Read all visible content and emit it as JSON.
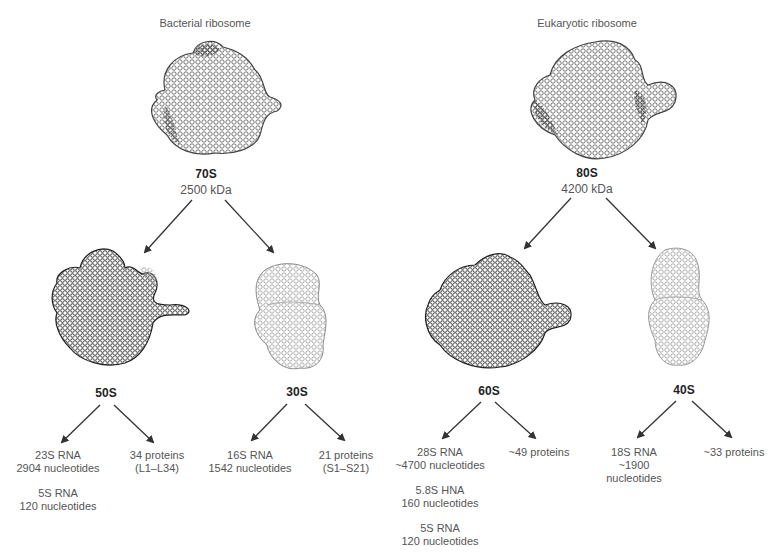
{
  "bacterial": {
    "title": "Bacterial ribosome",
    "whole": {
      "name": "70S",
      "mass": "2500 kDa"
    },
    "large": {
      "name": "50S",
      "rna": [
        {
          "line1": "23S RNA",
          "line2": "2904 nucleotides"
        },
        {
          "line1": "5S RNA",
          "line2": "120 nucleotides"
        }
      ],
      "proteins": {
        "line1": "34 proteins",
        "line2": "(L1–L34)"
      }
    },
    "small": {
      "name": "30S",
      "rna": [
        {
          "line1": "16S RNA",
          "line2": "1542 nucleotides"
        }
      ],
      "proteins": {
        "line1": "21 proteins",
        "line2": "(S1–S21)"
      }
    }
  },
  "eukaryotic": {
    "title": "Eukaryotic ribosome",
    "whole": {
      "name": "80S",
      "mass": "4200 kDa"
    },
    "large": {
      "name": "60S",
      "rna": [
        {
          "line1": "28S RNA",
          "line2": "~4700 nucleotides"
        },
        {
          "line1": "5.8S HNA",
          "line2": "160 nucleotides"
        },
        {
          "line1": "5S RNA",
          "line2": "120 nucleotides"
        }
      ],
      "proteins": {
        "line1": "~49 proteins"
      }
    },
    "small": {
      "name": "40S",
      "rna": [
        {
          "line1": "18S RNA",
          "line2": "~1900",
          "line3": "nucleotides"
        }
      ],
      "proteins": {
        "line1": "~33 proteins"
      }
    }
  },
  "colors": {
    "dark_structure": "#2a2a2a",
    "mid_structure": "#6e6e6e",
    "light_structure": "#9a9a9a",
    "arrow": "#333333"
  }
}
